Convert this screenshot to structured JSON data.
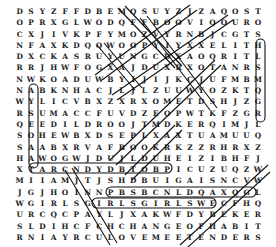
{
  "puzzle": {
    "type": "word-search",
    "rows": [
      "DSYZFFDBEMQSUYZJZAQOST",
      "OPRXGLWODQFFBOOVIQOUROJ",
      "CXJIVKPFYMOZVYRNBJCGTSENJ",
      "NFAXKDQQWOOPYIYXXELITHCO",
      "DXCKASRUYUNGCDXAOQRITLVLT",
      "RRJHWFOGXAJDUXRXOTANRSCAX",
      "NWKOADUWBYIJIJKCJUFMBMF",
      "NABKNHACJLJLZUUWYOZKTQTBI",
      "WYLICVBXZXRXOMETDSHJZGAI",
      "RSUMACCFUVDZEOPWTKFZGRXKY",
      "QEEDILDROOJTMDKERQIMJLSK",
      "SOHEWBXDSEPLXAXTUAMUUQN",
      "SAABXRVAFBOOKRKZZRHRXZNKJ",
      "HAWOGWJDUJLDUHEIZIBHFJLKL",
      "XTARCNDYDBTOBPICUZUQZWDXO",
      "MIIAMJTJSHDBUIGAISNCVWFZH",
      "JGJHOINNPBSBCNLDQAXQGLCQQ",
      "WGIRLSGIRLSGIRLSWECFHQWCE",
      "URCQCPAYLJXAKWFDYBEKERVML",
      "SLDIHCFCHCHANGEOFHABITELO",
      "RNIAYRCULOVEMEETENDERSIQL",
      "MRSTYZAKLMSVPJIUAHQHTIBEQ",
      "KZNMTXRFIHTSKPISVDJCUDBPV",
      "EMVAZLVIFJIHYDDSWPIIXEMQL",
      "NZPWYCUFCYLAWPQKIZPYJNTG"
    ],
    "found_words": [
      "GIRLS GIRLS GIRLS",
      "CHANGE OF HABIT",
      "LOVE ME TENDER",
      "CLAMBAKE",
      "BLUE HAWAII"
    ]
  }
}
